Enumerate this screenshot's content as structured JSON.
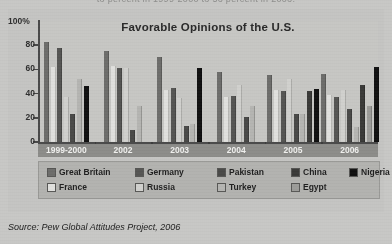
{
  "cut_text_top": "to percent in 1999-2000 to 56 percent in 2006.",
  "source": "Source: Pew Global Attitudes Project, 2006",
  "legend": {
    "row1": [
      "Great Britain",
      "Germany",
      "Pakistan",
      "China",
      "Nigeria"
    ],
    "row2": [
      "France",
      "Russia",
      "Turkey",
      "Egypt"
    ]
  },
  "colors": {
    "great_britain": "#6e6e6c",
    "france": "#e2e2df",
    "germany": "#565654",
    "russia": "#d2d2cf",
    "pakistan": "#4a4a48",
    "turkey": "#b6b6b3",
    "china": "#3a3a38",
    "egypt": "#9d9d9a",
    "nigeria": "#111111",
    "axis": "#4a4a4a",
    "band": "#8d8d8a",
    "paper": "#c9c9c7"
  },
  "chart_data": {
    "type": "bar",
    "title": "Favorable Opinions of the U.S.",
    "xlabel": "",
    "ylabel": "",
    "ylim": [
      0,
      100
    ],
    "yticks": [
      0,
      20,
      40,
      60,
      80,
      100
    ],
    "ytick_labels": [
      "0",
      "20",
      "40",
      "60",
      "80",
      "100%"
    ],
    "grid": false,
    "legend_position": "bottom",
    "categories": [
      "1999-2000",
      "2002",
      "2003",
      "2004",
      "2005",
      "2006"
    ],
    "series": [
      {
        "name": "Great Britain",
        "color": "#6e6e6c",
        "values": [
          83,
          75,
          70,
          58,
          55,
          56
        ]
      },
      {
        "name": "France",
        "color": "#e2e2df",
        "values": [
          62,
          63,
          43,
          37,
          43,
          39
        ]
      },
      {
        "name": "Germany",
        "color": "#565654",
        "values": [
          78,
          61,
          45,
          38,
          42,
          37
        ]
      },
      {
        "name": "Russia",
        "color": "#d2d2cf",
        "values": [
          37,
          61,
          36,
          47,
          52,
          43
        ]
      },
      {
        "name": "Pakistan",
        "color": "#4a4a48",
        "values": [
          23,
          10,
          13,
          21,
          23,
          27
        ]
      },
      {
        "name": "Turkey",
        "color": "#b6b6b3",
        "values": [
          52,
          30,
          15,
          30,
          23,
          12
        ]
      },
      {
        "name": "China",
        "color": "#3a3a38",
        "values": [
          null,
          null,
          null,
          null,
          42,
          47
        ]
      },
      {
        "name": "Egypt",
        "color": "#9d9d9a",
        "values": [
          null,
          null,
          null,
          null,
          null,
          30
        ]
      },
      {
        "name": "Nigeria",
        "color": "#111111",
        "values": [
          46,
          null,
          61,
          null,
          44,
          62
        ]
      }
    ]
  }
}
